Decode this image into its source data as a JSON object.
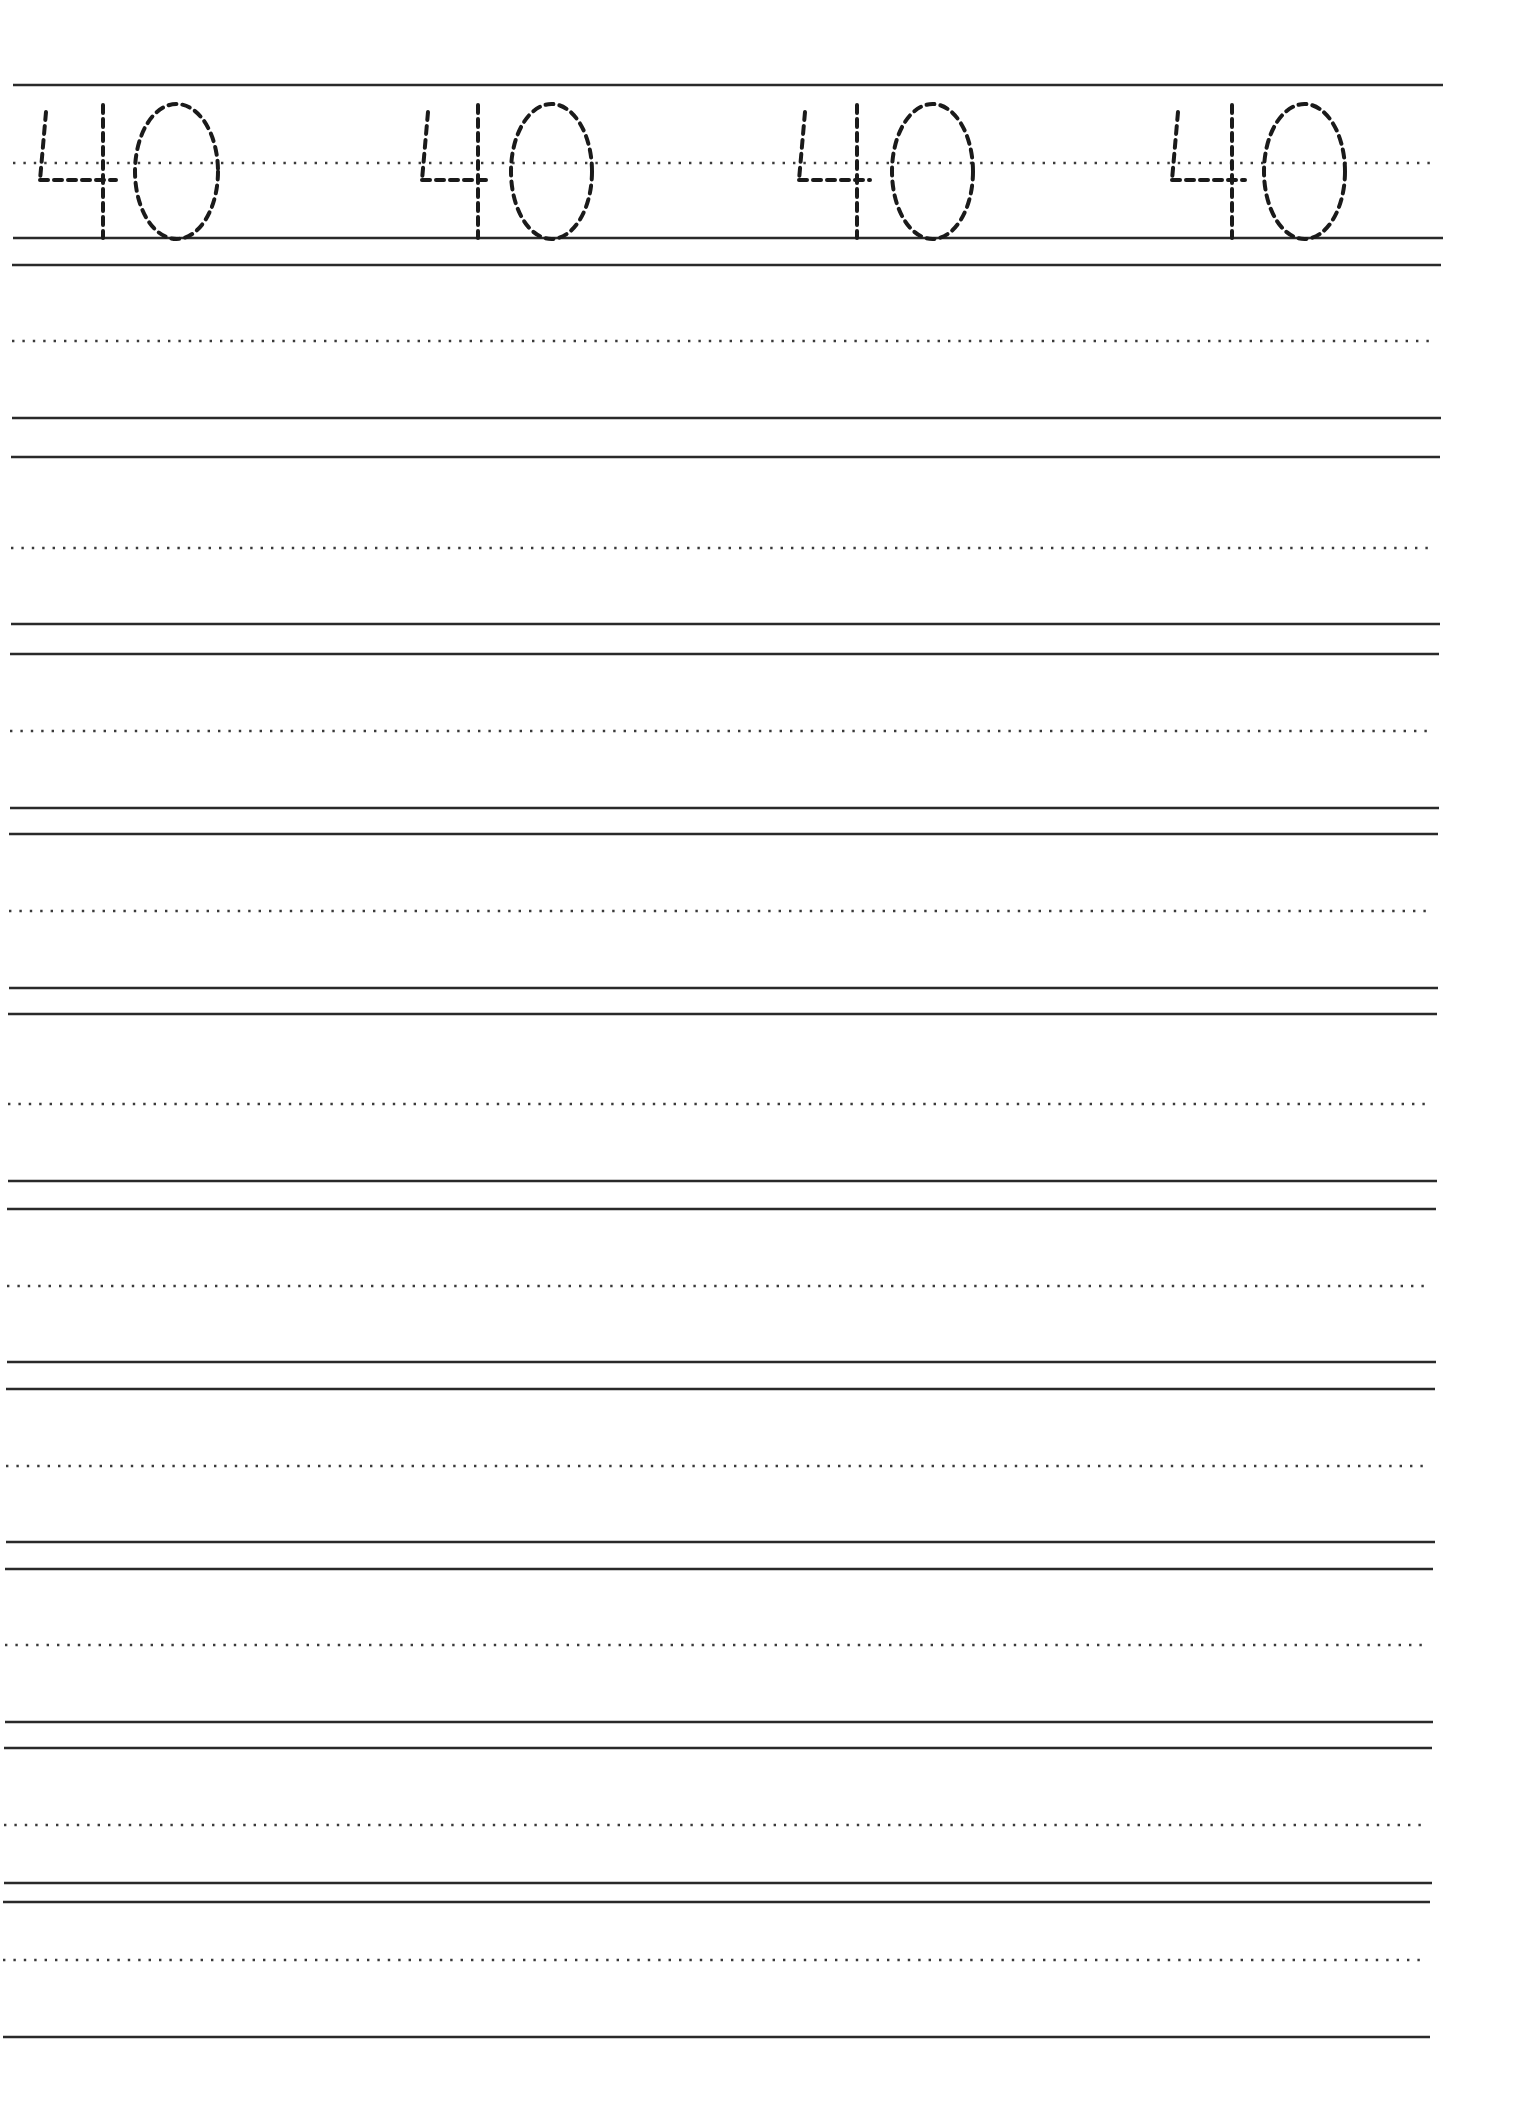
{
  "worksheet": {
    "type": "number-tracing-practice",
    "number": "40",
    "trace_row": {
      "label": "Trace the number",
      "glyphs": [
        "40",
        "40",
        "40",
        "40"
      ],
      "glyph_positions": [
        {
          "four_short_x": 43,
          "four_stem_x": 103,
          "four_cross_right": 116,
          "zero_left": 135,
          "zero_right": 218
        },
        {
          "four_short_x": 425,
          "four_stem_x": 478,
          "four_cross_right": 490,
          "zero_left": 511,
          "zero_right": 592
        },
        {
          "four_short_x": 802,
          "four_stem_x": 857,
          "four_cross_right": 870,
          "zero_left": 892,
          "zero_right": 973
        },
        {
          "four_short_x": 1175,
          "four_stem_x": 1232,
          "four_cross_right": 1245,
          "zero_left": 1264,
          "zero_right": 1345
        }
      ]
    },
    "rows": [
      {
        "top": 85,
        "mid": 163,
        "base": 238,
        "left": 13,
        "right": 1443
      },
      {
        "top": 265,
        "mid": 341,
        "base": 418,
        "left": 12,
        "right": 1441
      },
      {
        "top": 457,
        "mid": 548,
        "base": 624,
        "left": 11,
        "right": 1440
      },
      {
        "top": 654,
        "mid": 731,
        "base": 808,
        "left": 10,
        "right": 1439
      },
      {
        "top": 834,
        "mid": 911,
        "base": 988,
        "left": 9,
        "right": 1438
      },
      {
        "top": 1014,
        "mid": 1104,
        "base": 1181,
        "left": 8,
        "right": 1437
      },
      {
        "top": 1209,
        "mid": 1286,
        "base": 1362,
        "left": 7,
        "right": 1436
      },
      {
        "top": 1389,
        "mid": 1466,
        "base": 1542,
        "left": 6,
        "right": 1435
      },
      {
        "top": 1569,
        "mid": 1645,
        "base": 1722,
        "left": 5,
        "right": 1433
      },
      {
        "top": 1748,
        "mid": 1825,
        "base": 1883,
        "left": 4,
        "right": 1432
      },
      {
        "top": 1902,
        "mid": 1960,
        "base": 2037,
        "left": 3,
        "right": 1430
      }
    ],
    "colors": {
      "line": "#2a2a2a",
      "dotted": "#3a3a3a",
      "trace": "#1a1a1a",
      "background": "#ffffff"
    }
  }
}
